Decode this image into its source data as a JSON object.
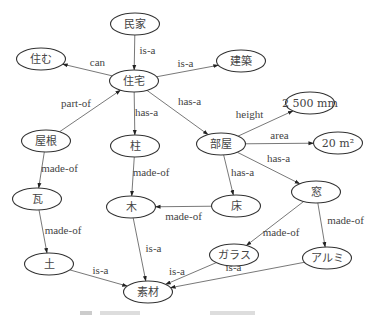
{
  "diagram": {
    "type": "semantic-network",
    "nodes": [
      {
        "id": "minka",
        "label": "民家"
      },
      {
        "id": "sumu",
        "label": "住む"
      },
      {
        "id": "jutaku",
        "label": "住宅"
      },
      {
        "id": "kenchiku",
        "label": "建築"
      },
      {
        "id": "yane",
        "label": "屋根"
      },
      {
        "id": "hashira",
        "label": "柱"
      },
      {
        "id": "heya",
        "label": "部屋"
      },
      {
        "id": "height_val",
        "label": "2 500 mm"
      },
      {
        "id": "area_val",
        "label": "20 m²"
      },
      {
        "id": "kawara",
        "label": "瓦"
      },
      {
        "id": "ki",
        "label": "木"
      },
      {
        "id": "yuka",
        "label": "床"
      },
      {
        "id": "mado",
        "label": "窓"
      },
      {
        "id": "tsuchi",
        "label": "土"
      },
      {
        "id": "sozai",
        "label": "素材"
      },
      {
        "id": "garasu",
        "label": "ガラス"
      },
      {
        "id": "arumi",
        "label": "アルミ"
      }
    ],
    "edges": [
      {
        "from": "minka",
        "to": "jutaku",
        "label": "is-a"
      },
      {
        "from": "jutaku",
        "to": "sumu",
        "label": "can"
      },
      {
        "from": "jutaku",
        "to": "kenchiku",
        "label": "is-a"
      },
      {
        "from": "yane",
        "to": "jutaku",
        "label": "part-of"
      },
      {
        "from": "jutaku",
        "to": "hashira",
        "label": "has-a"
      },
      {
        "from": "jutaku",
        "to": "heya",
        "label": "has-a"
      },
      {
        "from": "heya",
        "to": "height_val",
        "label": "height"
      },
      {
        "from": "heya",
        "to": "area_val",
        "label": "area"
      },
      {
        "from": "heya",
        "to": "mado",
        "label": "has-a"
      },
      {
        "from": "heya",
        "to": "yuka",
        "label": "has-a"
      },
      {
        "from": "yane",
        "to": "kawara",
        "label": "made-of"
      },
      {
        "from": "kawara",
        "to": "tsuchi",
        "label": "made-of"
      },
      {
        "from": "hashira",
        "to": "ki",
        "label": "made-of"
      },
      {
        "from": "yuka",
        "to": "ki",
        "label": "made-of"
      },
      {
        "from": "mado",
        "to": "garasu",
        "label": "made-of"
      },
      {
        "from": "mado",
        "to": "arumi",
        "label": "made-of"
      },
      {
        "from": "ki",
        "to": "sozai",
        "label": "is-a"
      },
      {
        "from": "tsuchi",
        "to": "sozai",
        "label": "is-a"
      },
      {
        "from": "garasu",
        "to": "sozai",
        "label": "is-a"
      },
      {
        "from": "arumi",
        "to": "sozai",
        "label": "is-a"
      }
    ]
  }
}
